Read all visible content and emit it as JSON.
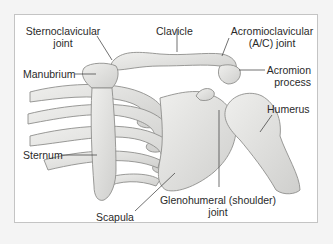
{
  "figure": {
    "labels": {
      "sternoclavicular_joint": [
        "Sternoclavicular",
        "joint"
      ],
      "clavicle": "Clavicle",
      "acromioclavicular_joint": [
        "Acromioclavicular",
        "(A/C) joint"
      ],
      "acromion_process": [
        "Acromion",
        "process"
      ],
      "manubrium": "Manubrium",
      "humerus": "Humerus",
      "sternum": "Sternum",
      "glenohumeral_joint": [
        "Glenohumeral (shoulder)",
        "joint"
      ],
      "scapula": "Scapula"
    },
    "colors": {
      "bone_fill": "#e2e2e0",
      "bone_stroke": "#8e8e8c",
      "leader_line": "#333333",
      "label_text": "#2a2a2a",
      "frame_border": "#c4c4c4",
      "background": "#f4f4f4"
    }
  }
}
